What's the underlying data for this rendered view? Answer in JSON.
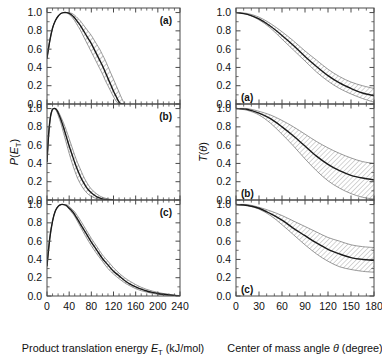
{
  "figure": {
    "background": "#ffffff",
    "line_color": "#1a1a1a",
    "band_color": "#8a8a8a"
  },
  "left_column": {
    "ylabel_main": "P",
    "ylabel_arg_open": "(",
    "ylabel_arg": "E",
    "ylabel_sub": "T",
    "ylabel_arg_close": ")",
    "xlabel_text": "Product translation energy ",
    "xlabel_sym": "E",
    "xlabel_sub": "T",
    "xlabel_units": " (kJ/mol)",
    "xticks": [
      "0",
      "40",
      "80",
      "120",
      "160",
      "200",
      "240"
    ],
    "yticks": [
      "0.0",
      "0.2",
      "0.4",
      "0.6",
      "0.8",
      "1.0"
    ],
    "panels": [
      "(a)",
      "(b)",
      "(c)"
    ]
  },
  "right_column": {
    "ylabel_main": "T",
    "ylabel_arg_open": "(",
    "ylabel_arg": "θ",
    "ylabel_arg_close": ")",
    "xlabel_text": "Center of mass angle ",
    "xlabel_sym": "θ",
    "xlabel_units": " (degree)",
    "xticks": [
      "0",
      "30",
      "60",
      "90",
      "120",
      "150",
      "180"
    ],
    "yticks": [
      "0.0",
      "0.2",
      "0.4",
      "0.6",
      "0.8",
      "1.0"
    ],
    "panels": [
      "(a)",
      "(b)",
      "(c)"
    ]
  },
  "chart_data": [
    {
      "type": "line",
      "panel": "(a)",
      "column": "left",
      "title": "",
      "xlabel": "Product translation energy E_T (kJ/mol)",
      "ylabel": "P (E_T)",
      "xlim": [
        0,
        240
      ],
      "ylim": [
        0.0,
        1.05
      ],
      "grid": false,
      "legend": "none",
      "series": [
        {
          "name": "P(E_T) best fit",
          "x": [
            0,
            5,
            10,
            15,
            20,
            25,
            30,
            35,
            40,
            45,
            50,
            55,
            60,
            65,
            70,
            75,
            80,
            85,
            90,
            95,
            100,
            105,
            110,
            115,
            120,
            125,
            130,
            135,
            140
          ],
          "values": [
            0.5,
            0.69,
            0.83,
            0.91,
            0.96,
            0.99,
            1.0,
            1.0,
            0.99,
            0.97,
            0.94,
            0.9,
            0.86,
            0.81,
            0.76,
            0.71,
            0.66,
            0.6,
            0.54,
            0.48,
            0.42,
            0.35,
            0.28,
            0.21,
            0.14,
            0.08,
            0.02,
            0.0,
            0.0
          ]
        },
        {
          "name": "upper uncertainty bound",
          "x": [
            0,
            5,
            10,
            15,
            20,
            25,
            30,
            35,
            40,
            45,
            50,
            55,
            60,
            65,
            70,
            75,
            80,
            85,
            90,
            95,
            100,
            105,
            110,
            115,
            120,
            125,
            130,
            135,
            140
          ],
          "values": [
            0.5,
            0.69,
            0.83,
            0.91,
            0.96,
            0.99,
            1.0,
            1.0,
            1.0,
            0.99,
            0.97,
            0.94,
            0.91,
            0.87,
            0.83,
            0.79,
            0.75,
            0.7,
            0.65,
            0.6,
            0.54,
            0.48,
            0.41,
            0.34,
            0.27,
            0.2,
            0.13,
            0.06,
            0.0
          ]
        },
        {
          "name": "lower uncertainty bound",
          "x": [
            0,
            5,
            10,
            15,
            20,
            25,
            30,
            35,
            40,
            45,
            50,
            55,
            60,
            65,
            70,
            75,
            80,
            85,
            90,
            95,
            100,
            105,
            110,
            115,
            120,
            125,
            130,
            135,
            140
          ],
          "values": [
            0.5,
            0.69,
            0.83,
            0.91,
            0.96,
            0.99,
            1.0,
            1.0,
            0.98,
            0.95,
            0.91,
            0.86,
            0.81,
            0.75,
            0.69,
            0.63,
            0.57,
            0.51,
            0.45,
            0.39,
            0.33,
            0.26,
            0.2,
            0.14,
            0.08,
            0.03,
            0.0,
            0.0,
            0.0
          ]
        }
      ]
    },
    {
      "type": "line",
      "panel": "(b)",
      "column": "left",
      "xlabel": "Product translation energy E_T (kJ/mol)",
      "ylabel": "P (E_T)",
      "xlim": [
        0,
        240
      ],
      "ylim": [
        0.0,
        1.05
      ],
      "grid": false,
      "legend": "none",
      "series": [
        {
          "name": "P(E_T) best fit",
          "x": [
            0,
            3,
            6,
            9,
            12,
            15,
            18,
            21,
            25,
            30,
            35,
            40,
            45,
            50,
            55,
            60,
            65,
            70,
            75,
            80,
            85,
            90,
            95,
            100,
            110,
            120
          ],
          "values": [
            0.42,
            0.72,
            0.9,
            0.98,
            1.0,
            1.0,
            0.98,
            0.94,
            0.88,
            0.79,
            0.69,
            0.59,
            0.5,
            0.41,
            0.33,
            0.26,
            0.2,
            0.15,
            0.11,
            0.08,
            0.055,
            0.035,
            0.022,
            0.012,
            0.003,
            0.0
          ]
        },
        {
          "name": "upper uncertainty bound",
          "x": [
            0,
            3,
            6,
            9,
            12,
            15,
            18,
            21,
            25,
            30,
            35,
            40,
            45,
            50,
            55,
            60,
            65,
            70,
            75,
            80,
            85,
            90,
            95,
            100,
            110,
            120
          ],
          "values": [
            0.42,
            0.72,
            0.9,
            0.98,
            1.0,
            1.0,
            0.99,
            0.96,
            0.91,
            0.84,
            0.76,
            0.67,
            0.58,
            0.49,
            0.41,
            0.34,
            0.27,
            0.21,
            0.16,
            0.12,
            0.09,
            0.065,
            0.045,
            0.03,
            0.012,
            0.004
          ]
        },
        {
          "name": "lower uncertainty bound",
          "x": [
            0,
            3,
            6,
            9,
            12,
            15,
            18,
            21,
            25,
            30,
            35,
            40,
            45,
            50,
            55,
            60,
            65,
            70,
            75,
            80,
            85,
            90,
            95,
            100,
            110,
            120
          ],
          "values": [
            0.42,
            0.72,
            0.9,
            0.98,
            1.0,
            0.99,
            0.96,
            0.91,
            0.84,
            0.73,
            0.62,
            0.51,
            0.41,
            0.32,
            0.24,
            0.18,
            0.13,
            0.09,
            0.06,
            0.04,
            0.025,
            0.015,
            0.008,
            0.004,
            0.0,
            0.0
          ]
        }
      ]
    },
    {
      "type": "line",
      "panel": "(c)",
      "column": "left",
      "xlabel": "Product translation energy E_T (kJ/mol)",
      "ylabel": "P (E_T)",
      "xlim": [
        0,
        240
      ],
      "ylim": [
        0.0,
        1.05
      ],
      "grid": false,
      "legend": "none",
      "series": [
        {
          "name": "P(E_T) best fit",
          "x": [
            0,
            5,
            10,
            15,
            20,
            25,
            30,
            35,
            40,
            45,
            50,
            60,
            70,
            80,
            90,
            100,
            110,
            120,
            130,
            140,
            150,
            160,
            170,
            180,
            190,
            200,
            210,
            220,
            230,
            240
          ],
          "values": [
            0.33,
            0.63,
            0.82,
            0.93,
            0.98,
            1.0,
            1.0,
            0.99,
            0.96,
            0.93,
            0.89,
            0.79,
            0.69,
            0.59,
            0.5,
            0.41,
            0.34,
            0.27,
            0.22,
            0.17,
            0.13,
            0.1,
            0.075,
            0.055,
            0.04,
            0.028,
            0.019,
            0.012,
            0.006,
            0.002
          ]
        },
        {
          "name": "upper uncertainty bound",
          "x": [
            0,
            5,
            10,
            15,
            20,
            25,
            30,
            35,
            40,
            45,
            50,
            60,
            70,
            80,
            90,
            100,
            110,
            120,
            130,
            140,
            150,
            160,
            170,
            180,
            190,
            200,
            210,
            220,
            230,
            240
          ],
          "values": [
            0.33,
            0.63,
            0.82,
            0.93,
            0.98,
            1.0,
            1.0,
            1.0,
            0.98,
            0.95,
            0.92,
            0.83,
            0.73,
            0.63,
            0.54,
            0.45,
            0.38,
            0.31,
            0.25,
            0.2,
            0.16,
            0.125,
            0.095,
            0.072,
            0.054,
            0.039,
            0.027,
            0.018,
            0.01,
            0.004
          ]
        },
        {
          "name": "lower uncertainty bound",
          "x": [
            0,
            5,
            10,
            15,
            20,
            25,
            30,
            35,
            40,
            45,
            50,
            60,
            70,
            80,
            90,
            100,
            110,
            120,
            130,
            140,
            150,
            160,
            170,
            180,
            190,
            200,
            210,
            220,
            230,
            240
          ],
          "values": [
            0.33,
            0.63,
            0.82,
            0.93,
            0.98,
            1.0,
            1.0,
            0.98,
            0.95,
            0.91,
            0.87,
            0.76,
            0.65,
            0.55,
            0.46,
            0.38,
            0.3,
            0.24,
            0.19,
            0.145,
            0.11,
            0.08,
            0.058,
            0.042,
            0.029,
            0.019,
            0.012,
            0.007,
            0.003,
            0.0
          ]
        }
      ]
    },
    {
      "type": "line",
      "panel": "(a)",
      "column": "right",
      "xlabel": "Center of mass angle θ (degree)",
      "ylabel": "T (θ)",
      "xlim": [
        0,
        180
      ],
      "ylim": [
        0.0,
        1.05
      ],
      "grid": false,
      "legend": "none",
      "series": [
        {
          "name": "T(θ) best fit",
          "x": [
            0,
            15,
            30,
            45,
            60,
            75,
            90,
            105,
            120,
            135,
            150,
            165,
            180
          ],
          "values": [
            1.0,
            0.98,
            0.93,
            0.85,
            0.75,
            0.64,
            0.52,
            0.41,
            0.31,
            0.23,
            0.17,
            0.12,
            0.09
          ]
        },
        {
          "name": "upper uncertainty bound",
          "x": [
            0,
            15,
            30,
            45,
            60,
            75,
            90,
            105,
            120,
            135,
            150,
            165,
            180
          ],
          "values": [
            1.0,
            0.99,
            0.95,
            0.88,
            0.79,
            0.69,
            0.58,
            0.48,
            0.38,
            0.3,
            0.24,
            0.2,
            0.17
          ]
        },
        {
          "name": "lower uncertainty bound",
          "x": [
            0,
            15,
            30,
            45,
            60,
            75,
            90,
            105,
            120,
            135,
            150,
            165,
            180
          ],
          "values": [
            1.0,
            0.98,
            0.92,
            0.83,
            0.71,
            0.59,
            0.47,
            0.35,
            0.25,
            0.17,
            0.11,
            0.06,
            0.02
          ]
        }
      ]
    },
    {
      "type": "line",
      "panel": "(b)",
      "column": "right",
      "xlabel": "Center of mass angle θ (degree)",
      "ylabel": "T (θ)",
      "xlim": [
        0,
        180
      ],
      "ylim": [
        0.0,
        1.05
      ],
      "grid": false,
      "legend": "none",
      "series": [
        {
          "name": "T(θ) best fit",
          "x": [
            0,
            15,
            30,
            45,
            60,
            75,
            90,
            105,
            120,
            135,
            150,
            165,
            180
          ],
          "values": [
            1.0,
            0.99,
            0.95,
            0.89,
            0.8,
            0.7,
            0.59,
            0.48,
            0.39,
            0.32,
            0.27,
            0.24,
            0.22
          ]
        },
        {
          "name": "upper uncertainty bound",
          "x": [
            0,
            15,
            30,
            45,
            60,
            75,
            90,
            105,
            120,
            135,
            150,
            165,
            180
          ],
          "values": [
            1.0,
            1.0,
            0.97,
            0.93,
            0.87,
            0.8,
            0.72,
            0.64,
            0.57,
            0.51,
            0.46,
            0.42,
            0.4
          ]
        },
        {
          "name": "lower uncertainty bound",
          "x": [
            0,
            15,
            30,
            45,
            60,
            75,
            90,
            105,
            120,
            135,
            150,
            165,
            180
          ],
          "values": [
            1.0,
            0.98,
            0.93,
            0.84,
            0.72,
            0.59,
            0.45,
            0.32,
            0.21,
            0.13,
            0.07,
            0.03,
            0.01
          ]
        }
      ]
    },
    {
      "type": "line",
      "panel": "(c)",
      "column": "right",
      "xlabel": "Center of mass angle θ (degree)",
      "ylabel": "T (θ)",
      "xlim": [
        0,
        180
      ],
      "ylim": [
        0.0,
        1.05
      ],
      "grid": false,
      "legend": "none",
      "series": [
        {
          "name": "T(θ) best fit",
          "x": [
            0,
            15,
            30,
            45,
            60,
            75,
            90,
            105,
            120,
            135,
            150,
            165,
            180
          ],
          "values": [
            1.0,
            0.99,
            0.96,
            0.9,
            0.83,
            0.74,
            0.66,
            0.58,
            0.51,
            0.46,
            0.42,
            0.4,
            0.39
          ]
        },
        {
          "name": "upper uncertainty bound",
          "x": [
            0,
            15,
            30,
            45,
            60,
            75,
            90,
            105,
            120,
            135,
            150,
            165,
            180
          ],
          "values": [
            1.0,
            1.0,
            0.97,
            0.93,
            0.88,
            0.82,
            0.76,
            0.7,
            0.64,
            0.6,
            0.56,
            0.54,
            0.53
          ]
        },
        {
          "name": "lower uncertainty bound",
          "x": [
            0,
            15,
            30,
            45,
            60,
            75,
            90,
            105,
            120,
            135,
            150,
            165,
            180
          ],
          "values": [
            1.0,
            0.99,
            0.95,
            0.88,
            0.78,
            0.67,
            0.56,
            0.46,
            0.38,
            0.32,
            0.29,
            0.27,
            0.26
          ]
        }
      ]
    }
  ]
}
